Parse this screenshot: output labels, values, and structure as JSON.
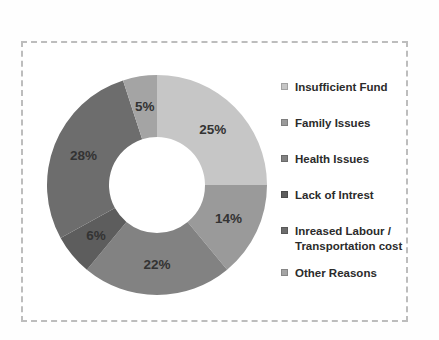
{
  "chart_data": {
    "type": "pie",
    "subtype": "donut",
    "title": "",
    "legend_position": "right",
    "direction": "clockwise",
    "start_angle_deg": 0,
    "categories": [
      "Insufficient Fund",
      "Family Issues",
      "Health Issues",
      "Lack of Intrest",
      "Inreased Labour / Transportation cost",
      "Other Reasons"
    ],
    "values": [
      25,
      14,
      22,
      6,
      28,
      5
    ],
    "data_labels": [
      "25%",
      "14%",
      "22%",
      "6%",
      "28%",
      "5%"
    ],
    "colors": [
      "#c6c6c6",
      "#9a9a9a",
      "#828282",
      "#5d5d5d",
      "#6d6d6d",
      "#a4a4a4"
    ]
  },
  "frame": {
    "border_color": "#bdbdbd",
    "background": "#ffffff"
  },
  "label_text_color": "#333333"
}
